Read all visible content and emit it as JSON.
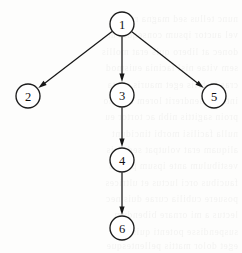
{
  "figure": {
    "kind": "directed-graph",
    "title": "",
    "width": 242,
    "height": 253,
    "background_color": "#fdfdfc",
    "stroke_color": "#171717",
    "node_fill_color": "#ffffff"
  },
  "chart_data": {
    "type": "diagram",
    "subtype": "directed-graph-tree",
    "title": "",
    "xlabel": "",
    "ylabel": "",
    "node_radius": 12,
    "nodes": [
      {
        "id": "1",
        "label": "1",
        "x": 122,
        "y": 24
      },
      {
        "id": "2",
        "label": "2",
        "x": 28,
        "y": 96
      },
      {
        "id": "3",
        "label": "3",
        "x": 122,
        "y": 95
      },
      {
        "id": "5",
        "label": "5",
        "x": 214,
        "y": 96
      },
      {
        "id": "4",
        "label": "4",
        "x": 122,
        "y": 160
      },
      {
        "id": "6",
        "label": "6",
        "x": 122,
        "y": 228
      }
    ],
    "edges": [
      {
        "from": "1",
        "to": "2",
        "directed": true
      },
      {
        "from": "1",
        "to": "3",
        "directed": true
      },
      {
        "from": "1",
        "to": "5",
        "directed": true
      },
      {
        "from": "3",
        "to": "4",
        "directed": true
      },
      {
        "from": "4",
        "to": "6",
        "directed": true
      }
    ],
    "edge_labels": []
  },
  "background_ghost_text": [
    {
      "text": "nunc tellus sed magna rutrum",
      "top": 14
    },
    {
      "text": "vel auctor ipsum consequat ut",
      "top": 30
    },
    {
      "text": "donec at libero quis erat mollis",
      "top": 47
    },
    {
      "text": "sem vitae nisl lacinia euismod",
      "top": 63
    },
    {
      "text": "cras in felis eget mauris porta",
      "top": 80
    },
    {
      "text": "integer hendrerit lorem ut odio",
      "top": 96
    },
    {
      "text": "proin sagittis nibh ac tortor eu",
      "top": 112
    },
    {
      "text": "nulla facilisi morbi tincidunt",
      "top": 129
    },
    {
      "text": "aliquam erat volutpat sed quis",
      "top": 145
    },
    {
      "text": "vestibulum ante ipsum primis",
      "top": 161
    },
    {
      "text": "faucibus orci luctus et ultrices",
      "top": 178
    },
    {
      "text": "posuere cubilia curae duis nec",
      "top": 194
    },
    {
      "text": "lectus a mi ornare bibendum",
      "top": 210
    },
    {
      "text": "suspendisse potenti quisque",
      "top": 227
    },
    {
      "text": "eget dolor mattis pellentesque",
      "top": 241
    }
  ]
}
